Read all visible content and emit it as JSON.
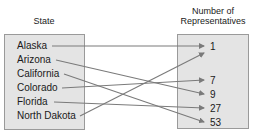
{
  "diagram": {
    "domain_header": "State",
    "range_header": "Number of Representatives",
    "range_header_lines": [
      "Number of",
      "Representatives"
    ],
    "domain": [
      "Alaska",
      "Arizona",
      "California",
      "Colorado",
      "Florida",
      "North Dakota"
    ],
    "range": [
      "1",
      "7",
      "9",
      "27",
      "53"
    ],
    "mappings": [
      {
        "from": "Alaska",
        "to": "1"
      },
      {
        "from": "Arizona",
        "to": "9"
      },
      {
        "from": "California",
        "to": "53"
      },
      {
        "from": "Colorado",
        "to": "7"
      },
      {
        "from": "Florida",
        "to": "27"
      },
      {
        "from": "North Dakota",
        "to": "1"
      }
    ],
    "colors": {
      "box_fill": "#e4e4e4",
      "box_border": "#9a9a9a",
      "arrow": "#7a7a7a"
    }
  }
}
